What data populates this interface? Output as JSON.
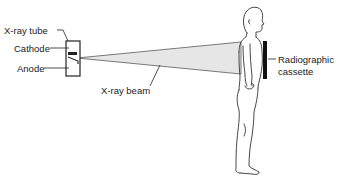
{
  "diagram": {
    "labels": {
      "xray_tube": "X-ray tube",
      "cathode": "Cathode",
      "anode": "Anode",
      "xray_beam": "X-ray beam",
      "cassette_line1": "Radiographic",
      "cassette_line2": "cassette"
    },
    "colors": {
      "ink": "#222222",
      "beam_fill": "#e4e4e4",
      "background": "#ffffff"
    }
  }
}
